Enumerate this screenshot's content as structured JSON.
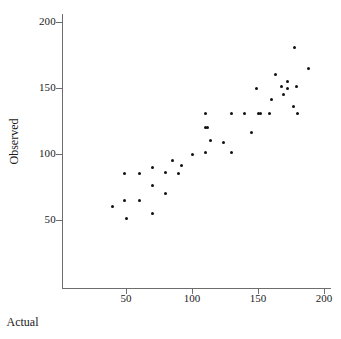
{
  "chart_data": {
    "type": "scatter",
    "title": "",
    "xlabel": "Actual",
    "ylabel": "Observed",
    "xlim": [
      20,
      205
    ],
    "ylim": [
      10,
      215
    ],
    "xticks": [
      50,
      100,
      150,
      200
    ],
    "yticks": [
      50,
      100,
      150,
      200
    ],
    "xtick_labels": [
      "50",
      "100",
      "150",
      "200"
    ],
    "ytick_labels": [
      "50",
      "100",
      "150",
      "200"
    ],
    "grid": false,
    "legend": null,
    "marker": "filled-circle",
    "marker_color": "#111111",
    "axis_color": "#6d6d6d",
    "series": [
      {
        "name": "observations",
        "points": [
          [
            40,
            60
          ],
          [
            49,
            85
          ],
          [
            49,
            65
          ],
          [
            50,
            51
          ],
          [
            60,
            85
          ],
          [
            60,
            65
          ],
          [
            70,
            90
          ],
          [
            70,
            76
          ],
          [
            70,
            55
          ],
          [
            80,
            86
          ],
          [
            80,
            70
          ],
          [
            85,
            95
          ],
          [
            90,
            85
          ],
          [
            92,
            91
          ],
          [
            100,
            100
          ],
          [
            110,
            131
          ],
          [
            110,
            120
          ],
          [
            110,
            101
          ],
          [
            112,
            120
          ],
          [
            114,
            110
          ],
          [
            124,
            109
          ],
          [
            130,
            131
          ],
          [
            130,
            101
          ],
          [
            140,
            131
          ],
          [
            145,
            116
          ],
          [
            149,
            150
          ],
          [
            150,
            131
          ],
          [
            152,
            131
          ],
          [
            159,
            131
          ],
          [
            160,
            141
          ],
          [
            163,
            160
          ],
          [
            168,
            151
          ],
          [
            169,
            145
          ],
          [
            172,
            155
          ],
          [
            172,
            150
          ],
          [
            177,
            136
          ],
          [
            178,
            181
          ],
          [
            179,
            151
          ],
          [
            180,
            131
          ],
          [
            188,
            165
          ]
        ]
      }
    ]
  },
  "axes": {
    "x_title": "Actual",
    "y_title": "Observed"
  }
}
